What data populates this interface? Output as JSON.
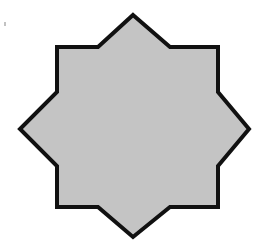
{
  "figure": {
    "shape": "eight-pointed-star",
    "fill_color": "#c4c4c4",
    "stroke_color": "#111111",
    "stroke_width": 4,
    "points": "133,15 170,47 218,47 218,92 249,129 218,166 218,207 170,207 133,237 98,207 57,207 57,166 20,129 57,92 57,47 98,47"
  }
}
